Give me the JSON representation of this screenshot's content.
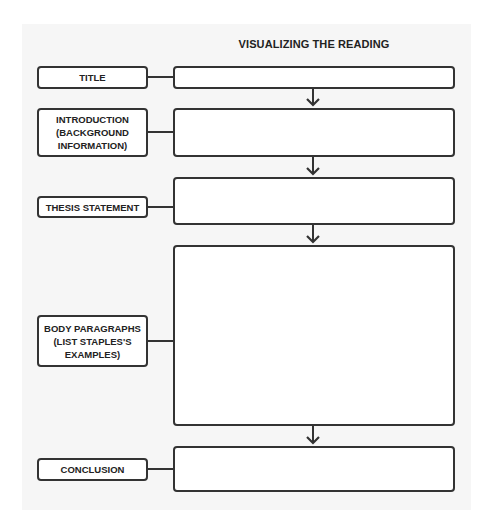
{
  "diagram": {
    "heading": "VISUALIZING THE READING",
    "rows": [
      {
        "id": "title",
        "label": "TITLE",
        "answer": ""
      },
      {
        "id": "introduction",
        "label": "INTRODUCTION\n(BACKGROUND\nINFORMATION)",
        "answer": ""
      },
      {
        "id": "thesis",
        "label": "THESIS STATEMENT",
        "answer": ""
      },
      {
        "id": "body",
        "label": "BODY PARAGRAPHS\n(LIST STAPLES'S\nEXAMPLES)",
        "answer": ""
      },
      {
        "id": "conclusion",
        "label": "CONCLUSION",
        "answer": ""
      }
    ],
    "colors": {
      "panel_background": "#f6f6f6",
      "box_border": "#333333",
      "box_fill": "#ffffff",
      "text": "#222222"
    }
  }
}
